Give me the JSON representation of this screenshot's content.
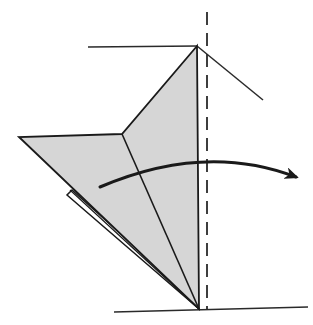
{
  "diagram": {
    "type": "origami-fold-step",
    "colors": {
      "background": "#ffffff",
      "paper_fill": "#d6d6d6",
      "line": "#1a1a1a",
      "reference_line": "#2a2a2a"
    },
    "elements": {
      "fold_line": {
        "style": "dashed",
        "x": 207,
        "y1": 12,
        "y2": 310
      },
      "paper_outline": {
        "points": [
          [
            197,
            46
          ],
          [
            122,
            134
          ],
          [
            19,
            137
          ],
          [
            199,
            309
          ]
        ],
        "inner_crease": [
          [
            122,
            134
          ],
          [
            199,
            309
          ]
        ],
        "center_edge": [
          [
            197,
            46
          ],
          [
            199,
            309
          ]
        ]
      },
      "back_flap": {
        "points": [
          [
            72,
            190
          ],
          [
            67,
            195
          ],
          [
            199,
            309
          ]
        ]
      },
      "reference_lines": [
        {
          "name": "top-left-guide",
          "from": [
            88,
            47
          ],
          "to": [
            197,
            46
          ]
        },
        {
          "name": "top-right-guide",
          "from": [
            197,
            46
          ],
          "to": [
            263,
            100
          ]
        },
        {
          "name": "bottom-guide",
          "from": [
            114,
            312
          ],
          "to": [
            308,
            307
          ]
        }
      ],
      "arrow": {
        "direction": "left-to-right",
        "meaning": "fold-over"
      }
    }
  }
}
